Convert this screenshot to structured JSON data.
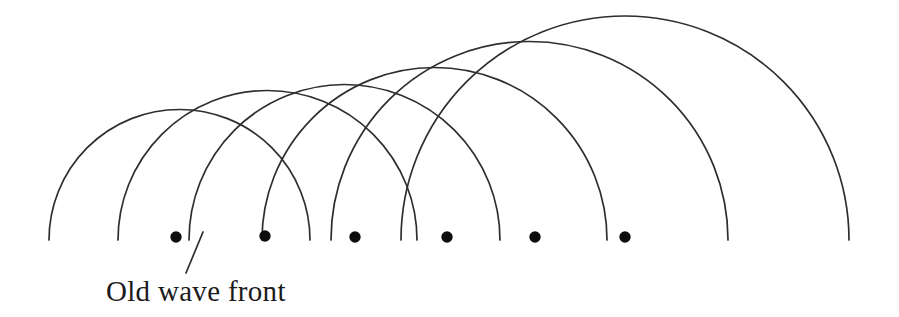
{
  "canvas": {
    "width": 899,
    "height": 317,
    "background": "#ffffff"
  },
  "styles": {
    "arc_color": "#2e2e2e",
    "arc_stroke_width": 1.7,
    "dot_color": "#0d0d0d",
    "dot_radius": 5.7,
    "leader_color": "#2e2e2e",
    "leader_stroke_width": 1.7,
    "text_color": "#1b1b1b"
  },
  "diagram": {
    "type": "huygens-wavelets",
    "baseline_y": 240,
    "wavelets": [
      {
        "left_x": 49,
        "right_x": 310
      },
      {
        "left_x": 118,
        "right_x": 417
      },
      {
        "left_x": 189,
        "right_x": 500
      },
      {
        "left_x": 262,
        "right_x": 607
      },
      {
        "left_x": 331,
        "right_x": 728
      },
      {
        "left_x": 401,
        "right_x": 849
      }
    ],
    "sources": [
      {
        "x": 176,
        "y": 237
      },
      {
        "x": 265,
        "y": 236
      },
      {
        "x": 355,
        "y": 237
      },
      {
        "x": 447,
        "y": 237
      },
      {
        "x": 535,
        "y": 237
      },
      {
        "x": 625,
        "y": 237
      }
    ],
    "leader": {
      "x1": 203,
      "y1": 232,
      "x2": 186,
      "y2": 273
    },
    "label": {
      "text": "Old wave front",
      "x": 106,
      "y": 277,
      "font_size": 29
    }
  }
}
